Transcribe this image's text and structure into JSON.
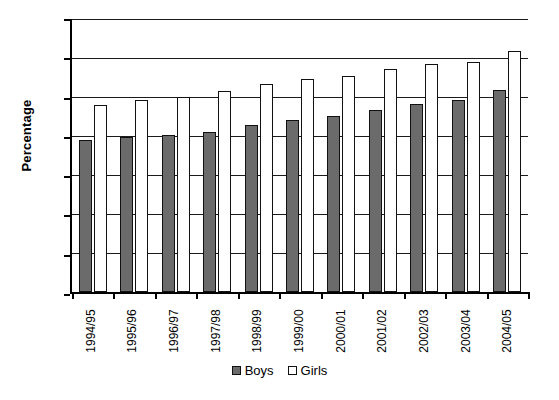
{
  "chart_data": {
    "type": "bar",
    "title": "",
    "xlabel": "",
    "ylabel": "Percentage",
    "ylim": [
      0,
      70
    ],
    "ytick_step": 10,
    "yticks": [
      70,
      60,
      50,
      40,
      30,
      20,
      10,
      0
    ],
    "grid": "horizontal",
    "legend_position": "bottom-center",
    "categories": [
      "1994/95",
      "1995/96",
      "1996/97",
      "1997/98",
      "1998/99",
      "1999/00",
      "2000/01",
      "2001/02",
      "2002/03",
      "2003/04",
      "2004/05"
    ],
    "series": [
      {
        "name": "Boys",
        "color": "#6b6b6b",
        "values": [
          39.0,
          39.8,
          40.3,
          41.0,
          42.8,
          44.0,
          45.1,
          46.6,
          48.3,
          49.2,
          51.8
        ]
      },
      {
        "name": "Girls",
        "color": "#ffffff",
        "values": [
          47.9,
          49.3,
          50.1,
          51.6,
          53.4,
          54.6,
          55.4,
          57.2,
          58.5,
          59.0,
          61.9
        ]
      }
    ]
  },
  "axis": {
    "y_title": "Percentage"
  },
  "legend": {
    "items": [
      {
        "label": "Boys"
      },
      {
        "label": "Girls"
      }
    ]
  }
}
